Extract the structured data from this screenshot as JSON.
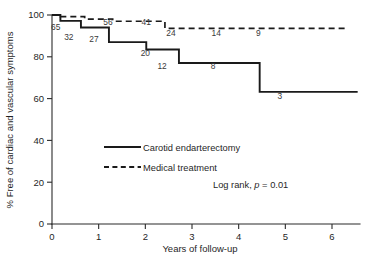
{
  "chart_data": {
    "type": "line",
    "title": "",
    "xlabel": "Years of follow-up",
    "ylabel": "% Free of cardiac and vascular symptoms",
    "xlim": [
      0,
      6.6
    ],
    "ylim": [
      0,
      100
    ],
    "xticks": [
      "0",
      "1",
      "2",
      "3",
      "4",
      "5",
      "6"
    ],
    "xtick_values": [
      0,
      1,
      2,
      3,
      4,
      5,
      6
    ],
    "yticks": [
      "0",
      "20",
      "40",
      "60",
      "80",
      "100"
    ],
    "ytick_values": [
      0,
      20,
      40,
      60,
      80,
      100
    ],
    "grid": false,
    "legend_position": "center",
    "annotation": "Log rank, p = 0.01",
    "annotation_stat": "p",
    "annotation_prefix": "Log rank, ",
    "annotation_suffix": " = 0.01",
    "series": [
      {
        "name": "Carotid endarterectomy",
        "style": "solid",
        "step": true,
        "x": [
          0.0,
          0.18,
          0.18,
          0.62,
          0.62,
          1.22,
          1.22,
          2.02,
          2.02,
          2.72,
          2.72,
          4.45,
          4.45,
          6.55
        ],
        "y": [
          100,
          100,
          97.2,
          97.2,
          94.0,
          94.0,
          87.0,
          87.0,
          83.5,
          83.5,
          77.0,
          77.0,
          63.2,
          63.2
        ],
        "risk_labels": [
          {
            "text": "65",
            "x": 0.08,
            "y": 93.0
          },
          {
            "text": "32",
            "x": 0.36,
            "y": 88.2
          },
          {
            "text": "27",
            "x": 0.9,
            "y": 87.3
          },
          {
            "text": "20",
            "x": 2.0,
            "y": 80.5
          },
          {
            "text": "12",
            "x": 2.36,
            "y": 74.0
          },
          {
            "text": "8",
            "x": 3.45,
            "y": 74.0
          },
          {
            "text": "3",
            "x": 4.88,
            "y": 59.6
          }
        ]
      },
      {
        "name": "Medical treatment",
        "style": "dashed",
        "step": true,
        "x": [
          0.0,
          0.18,
          0.18,
          0.7,
          0.7,
          1.3,
          1.3,
          2.42,
          2.42,
          6.35
        ],
        "y": [
          100,
          100,
          99.2,
          99.2,
          98.0,
          98.0,
          97.0,
          97.0,
          93.6,
          93.6
        ],
        "risk_labels": [
          {
            "text": "56",
            "x": 1.2,
            "y": 95.2
          },
          {
            "text": "41",
            "x": 2.02,
            "y": 95.2
          },
          {
            "text": "24",
            "x": 2.55,
            "y": 89.8
          },
          {
            "text": "14",
            "x": 3.52,
            "y": 89.8
          },
          {
            "text": "9",
            "x": 4.42,
            "y": 89.8
          }
        ]
      }
    ]
  },
  "legend": {
    "items": [
      {
        "label": "Carotid endarterectomy",
        "style": "solid"
      },
      {
        "label": "Medical treatment",
        "style": "dashed"
      }
    ]
  }
}
